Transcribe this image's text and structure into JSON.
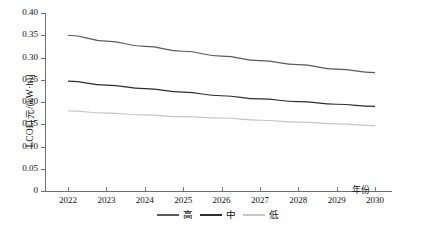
{
  "chart_data": {
    "type": "line",
    "title": "",
    "xlabel": "年份",
    "ylabel": "LCOE[元/(kW·h)]",
    "x": [
      2022,
      2023,
      2024,
      2025,
      2026,
      2027,
      2028,
      2029,
      2030
    ],
    "categories": [
      "2022",
      "2023",
      "2024",
      "2025",
      "2026",
      "2027",
      "2028",
      "2029",
      "2030"
    ],
    "xlim": [
      2022,
      2030
    ],
    "ylim": [
      0,
      0.4
    ],
    "yticks": [
      "0",
      "0.05",
      "0.10",
      "0.15",
      "0.20",
      "0.25",
      "0.30",
      "0.35",
      "0.40"
    ],
    "ytick_values": [
      0,
      0.05,
      0.1,
      0.15,
      0.2,
      0.25,
      0.3,
      0.35,
      0.4
    ],
    "grid": false,
    "legend_position": "bottom-center",
    "series": [
      {
        "name": "高",
        "color": "#5a5a5a",
        "values": [
          0.35,
          0.337,
          0.325,
          0.314,
          0.303,
          0.293,
          0.284,
          0.274,
          0.266
        ]
      },
      {
        "name": "中",
        "color": "#2e2e2e",
        "values": [
          0.247,
          0.238,
          0.23,
          0.222,
          0.214,
          0.207,
          0.201,
          0.195,
          0.19
        ]
      },
      {
        "name": "低",
        "color": "#c6c6c6",
        "values": [
          0.18,
          0.175,
          0.171,
          0.167,
          0.164,
          0.159,
          0.155,
          0.151,
          0.147
        ]
      }
    ]
  },
  "legend": {
    "items": [
      {
        "label": "高",
        "color": "#5a5a5a"
      },
      {
        "label": "中",
        "color": "#2e2e2e"
      },
      {
        "label": "低",
        "color": "#c6c6c6"
      }
    ]
  },
  "axes": {
    "y_title": "LCOE[元/(kW·h)]",
    "x_title": "年份"
  }
}
